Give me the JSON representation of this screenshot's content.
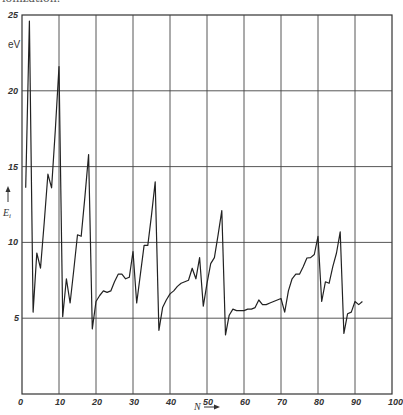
{
  "caption_fragment": "ionization.",
  "chart_data": {
    "type": "line",
    "title": "",
    "xlabel": "N",
    "ylabel": "E_i",
    "y_unit": "eV",
    "xlim": [
      0,
      100
    ],
    "ylim": [
      0,
      25
    ],
    "grid": true,
    "x_ticks": [
      0,
      10,
      20,
      30,
      40,
      50,
      60,
      70,
      80,
      90,
      100
    ],
    "y_ticks": [
      5,
      10,
      15,
      20,
      25
    ],
    "legend": null,
    "series": [
      {
        "name": "First ionization energy",
        "x": [
          1,
          2,
          3,
          4,
          5,
          6,
          7,
          8,
          9,
          10,
          11,
          12,
          13,
          14,
          15,
          16,
          17,
          18,
          19,
          20,
          21,
          22,
          23,
          24,
          25,
          26,
          27,
          28,
          29,
          30,
          31,
          32,
          33,
          34,
          35,
          36,
          37,
          38,
          39,
          40,
          41,
          42,
          43,
          44,
          45,
          46,
          47,
          48,
          49,
          50,
          51,
          52,
          53,
          54,
          55,
          56,
          57,
          58,
          59,
          60,
          61,
          62,
          63,
          64,
          65,
          66,
          67,
          68,
          69,
          70,
          71,
          72,
          73,
          74,
          75,
          76,
          77,
          78,
          79,
          80,
          81,
          82,
          83,
          84,
          85,
          86,
          87,
          88,
          89,
          90,
          91,
          92
        ],
        "values": [
          13.6,
          24.6,
          5.4,
          9.3,
          8.3,
          11.3,
          14.5,
          13.6,
          17.4,
          21.6,
          5.1,
          7.6,
          6.0,
          8.2,
          10.5,
          10.4,
          13.0,
          15.8,
          4.3,
          6.1,
          6.5,
          6.8,
          6.7,
          6.8,
          7.4,
          7.9,
          7.9,
          7.6,
          7.7,
          9.4,
          6.0,
          7.9,
          9.8,
          9.8,
          11.8,
          14.0,
          4.2,
          5.7,
          6.2,
          6.6,
          6.8,
          7.1,
          7.3,
          7.4,
          7.5,
          8.3,
          7.6,
          9.0,
          5.8,
          7.3,
          8.6,
          9.0,
          10.5,
          12.1,
          3.9,
          5.2,
          5.6,
          5.5,
          5.5,
          5.5,
          5.6,
          5.6,
          5.7,
          6.2,
          5.9,
          5.9,
          6.0,
          6.1,
          6.2,
          6.3,
          5.4,
          6.8,
          7.6,
          7.9,
          7.9,
          8.4,
          8.97,
          9.0,
          9.2,
          10.4,
          6.1,
          7.4,
          7.3,
          8.4,
          9.3,
          10.7,
          4.0,
          5.3,
          5.4,
          6.1,
          5.9,
          6.1
        ]
      }
    ]
  }
}
